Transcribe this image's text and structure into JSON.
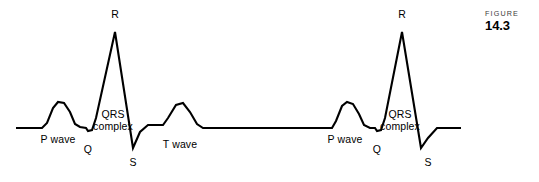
{
  "figure": {
    "caption_word": "FIGURE",
    "caption_number": "14.3"
  },
  "colors": {
    "background": "#ffffff",
    "trace": "#000000",
    "label": "#000000",
    "caption_word": "#3b3b3b"
  },
  "labels": {
    "beat1": {
      "p_wave": "P wave",
      "q": "Q",
      "r": "R",
      "s": "S",
      "qrs_line1": "QRS",
      "qrs_line2": "complex",
      "t_wave": "T wave"
    },
    "beat2": {
      "p_wave": "P wave",
      "q": "Q",
      "r": "R",
      "s": "S",
      "qrs_line1": "QRS",
      "qrs_line2": "complex"
    }
  },
  "chart_data": {
    "type": "line",
    "title": "",
    "xlabel": "",
    "ylabel": "",
    "grid": false,
    "legend": "none",
    "xlim": [
      0,
      539
    ],
    "ylim": [
      182,
      0
    ],
    "baseline_y": 128,
    "series": [
      {
        "name": "ecg-trace",
        "points": [
          [
            16,
            128
          ],
          [
            42,
            128
          ],
          [
            47,
            123
          ],
          [
            53,
            108
          ],
          [
            58,
            102
          ],
          [
            64,
            103
          ],
          [
            70,
            112
          ],
          [
            75,
            124
          ],
          [
            80,
            127
          ],
          [
            86,
            128
          ],
          [
            88,
            131
          ],
          [
            92,
            130
          ],
          [
            96,
            118
          ],
          [
            115,
            32
          ],
          [
            133,
            148
          ],
          [
            140,
            132
          ],
          [
            148,
            125
          ],
          [
            155,
            125
          ],
          [
            163,
            125
          ],
          [
            168,
            118
          ],
          [
            176,
            105
          ],
          [
            183,
            103
          ],
          [
            190,
            112
          ],
          [
            197,
            124
          ],
          [
            203,
            128
          ],
          [
            332,
            128
          ],
          [
            336,
            121
          ],
          [
            342,
            106
          ],
          [
            347,
            102
          ],
          [
            353,
            104
          ],
          [
            359,
            114
          ],
          [
            364,
            125
          ],
          [
            370,
            128
          ],
          [
            375,
            128
          ],
          [
            377,
            131
          ],
          [
            381,
            130
          ],
          [
            385,
            118
          ],
          [
            402,
            32
          ],
          [
            421,
            148
          ],
          [
            428,
            138
          ],
          [
            437,
            128
          ],
          [
            445,
            128
          ],
          [
            461,
            128
          ]
        ]
      }
    ],
    "annotations": [
      {
        "text": "P wave",
        "x": 58,
        "y": 140
      },
      {
        "text": "Q",
        "x": 88,
        "y": 150
      },
      {
        "text": "R",
        "x": 115,
        "y": 16
      },
      {
        "text": "S",
        "x": 133,
        "y": 163
      },
      {
        "text": "QRS complex",
        "x": 113,
        "y": 119
      },
      {
        "text": "T wave",
        "x": 180,
        "y": 146
      },
      {
        "text": "P wave",
        "x": 345,
        "y": 140
      },
      {
        "text": "Q",
        "x": 377,
        "y": 150
      },
      {
        "text": "R",
        "x": 402,
        "y": 16
      },
      {
        "text": "S",
        "x": 428,
        "y": 163
      },
      {
        "text": "QRS complex",
        "x": 400,
        "y": 119
      }
    ]
  }
}
